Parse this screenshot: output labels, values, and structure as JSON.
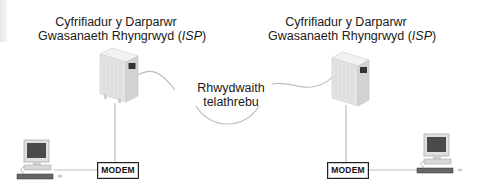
{
  "diagram": {
    "isp_server_left": {
      "label_line1": "Cyfrifiadur y Darparwr",
      "label_line2_prefix": "Gwasanaeth Rhyngrwyd (",
      "label_line2_isp": "ISP",
      "label_line2_suffix": ")"
    },
    "isp_server_right": {
      "label_line1": "Cyfrifiadur y Darparwr",
      "label_line2_prefix": "Gwasanaeth Rhyngrwyd (",
      "label_line2_isp": "ISP",
      "label_line2_suffix": ")"
    },
    "network": {
      "label_line1": "Rhwydwaith",
      "label_line2": "telathrebu"
    },
    "modem_left": {
      "label": "MODEM"
    },
    "modem_right": {
      "label": "MODEM"
    },
    "icons": [
      "server-icon",
      "server-icon",
      "computer-icon",
      "computer-icon",
      "cable-line"
    ],
    "colors": {
      "line": "#c0c0c0",
      "text": "#1a1a1a",
      "server_body": "#e4e4e4",
      "monitor_screen": "#4a4a4a"
    }
  }
}
